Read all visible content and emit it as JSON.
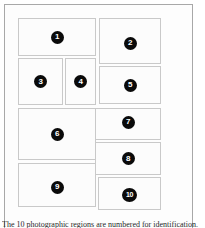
{
  "figure": {
    "frame_color": "#a8a8a8",
    "cell_border_color": "#c9c9c9",
    "cell_fill_color": "#fcfcfc",
    "badge_color": "#0a0a0a",
    "badge_text_color": "#ffffff",
    "cells": [
      {
        "label": "1"
      },
      {
        "label": "2"
      },
      {
        "label": "3"
      },
      {
        "label": "4"
      },
      {
        "label": "5"
      },
      {
        "label": "6"
      },
      {
        "label": "7"
      },
      {
        "label": "8"
      },
      {
        "label": "9"
      },
      {
        "label": "10"
      }
    ]
  },
  "caption": {
    "text": "The 10 photographic regions are numbered for identification."
  }
}
